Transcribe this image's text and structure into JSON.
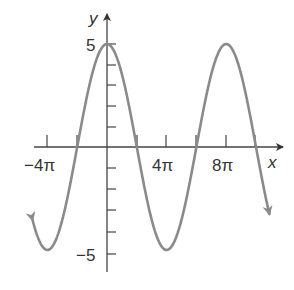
{
  "chart_data": {
    "type": "line",
    "title": "",
    "function": "y = 5cos(x/4)",
    "xlabel": "x",
    "ylabel": "y",
    "x_ticks": [
      {
        "value_pi": -4,
        "label": "−4π"
      },
      {
        "value_pi": -2,
        "label": ""
      },
      {
        "value_pi": 0,
        "label": ""
      },
      {
        "value_pi": 2,
        "label": ""
      },
      {
        "value_pi": 4,
        "label": "4π"
      },
      {
        "value_pi": 6,
        "label": ""
      },
      {
        "value_pi": 8,
        "label": "8π"
      },
      {
        "value_pi": 10,
        "label": ""
      }
    ],
    "y_ticks": [
      {
        "value": 5,
        "label": "5"
      },
      {
        "value": 4,
        "label": ""
      },
      {
        "value": 3,
        "label": ""
      },
      {
        "value": 2,
        "label": ""
      },
      {
        "value": 1,
        "label": ""
      },
      {
        "value": -1,
        "label": ""
      },
      {
        "value": -2,
        "label": ""
      },
      {
        "value": -3,
        "label": ""
      },
      {
        "value": -4,
        "label": ""
      },
      {
        "value": -5,
        "label": "−5"
      }
    ],
    "xlim_pi": [
      -5.2,
      11.5
    ],
    "ylim": [
      -5.5,
      5.8
    ],
    "amplitude": 5,
    "period": "8π",
    "key_points": [
      {
        "x": "−4π",
        "y": -5
      },
      {
        "x": "−2π",
        "y": 0
      },
      {
        "x": "0",
        "y": 5
      },
      {
        "x": "2π",
        "y": 0
      },
      {
        "x": "4π",
        "y": -5
      },
      {
        "x": "6π",
        "y": 0
      },
      {
        "x": "8π",
        "y": 5
      },
      {
        "x": "10π",
        "y": 0
      }
    ],
    "curve_color": "#8a8a8a",
    "axis_color": "#444444",
    "grid": false,
    "legend": null
  },
  "labels": {
    "x_axis": "x",
    "y_axis": "y",
    "x_tick_neg4pi": "−4π",
    "x_tick_4pi": "4π",
    "x_tick_8pi": "8π",
    "y_tick_5": "5",
    "y_tick_neg5": "−5"
  }
}
